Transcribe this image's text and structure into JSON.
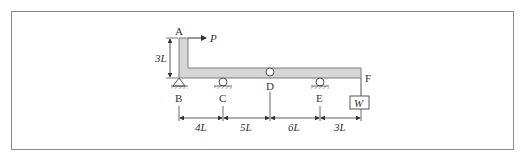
{
  "diagram": {
    "type": "structural-beam-figure",
    "points": {
      "A": "A",
      "B": "B",
      "C": "C",
      "D": "D",
      "E": "E",
      "F": "F"
    },
    "load": {
      "force_label": "P",
      "weight_label": "W"
    },
    "dimensions": {
      "vertical": "3L",
      "spans": [
        "4L",
        "5L",
        "6L",
        "3L"
      ]
    },
    "colors": {
      "member_fill": "#d6d6d6",
      "member_stroke": "#7a7a7a",
      "line": "#444444",
      "frame": "#8a8a8a"
    }
  }
}
